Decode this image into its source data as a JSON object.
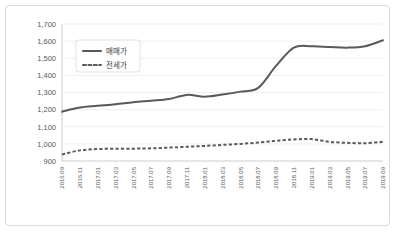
{
  "chart_data": {
    "type": "line",
    "title": "",
    "xlabel": "",
    "ylabel": "",
    "ylim": [
      900,
      1700
    ],
    "ytick_step": 100,
    "grid": true,
    "legend_position": "top-left",
    "yticks": [
      "1,700",
      "1,600",
      "1,500",
      "1,400",
      "1,300",
      "1,200",
      "1,100",
      "1,000",
      "900"
    ],
    "ytick_values": [
      1700,
      1600,
      1500,
      1400,
      1300,
      1200,
      1100,
      1000,
      900
    ],
    "categories": [
      "2016.09",
      "2016.11",
      "2017.01",
      "2017.03",
      "2017.05",
      "2017.07",
      "2017.09",
      "2017.11",
      "2018.01",
      "2018.03",
      "2018.05",
      "2018.07",
      "2018.09",
      "2018.11",
      "2019.01",
      "2019.03",
      "2019.05",
      "2019.07",
      "2019.09"
    ],
    "series": [
      {
        "name": "매매가",
        "style": "solid",
        "color": "#595959",
        "values": [
          1188,
          1212,
          1222,
          1231,
          1243,
          1252,
          1262,
          1286,
          1275,
          1288,
          1305,
          1327,
          1455,
          1562,
          1570,
          1566,
          1562,
          1570,
          1605
        ]
      },
      {
        "name": "전세가",
        "style": "dashed",
        "color": "#595959",
        "values": [
          938,
          962,
          970,
          971,
          972,
          974,
          978,
          983,
          988,
          994,
          1000,
          1008,
          1018,
          1026,
          1028,
          1012,
          1006,
          1004,
          1012
        ]
      }
    ],
    "legend": [
      "매매가",
      "전세가"
    ]
  }
}
